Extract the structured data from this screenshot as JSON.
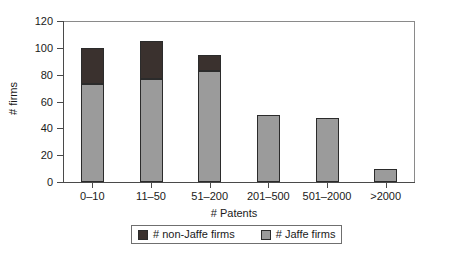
{
  "chart_data": {
    "type": "bar",
    "stacked": true,
    "title": "",
    "xlabel": "# Patents",
    "ylabel": "# firms",
    "categories": [
      "0–10",
      "11–50",
      "51–200",
      "201–500",
      "501–2000",
      ">2000"
    ],
    "series": [
      {
        "name": "# Jaffe firms",
        "color": "#9b9b9b",
        "values": [
          73,
          77,
          83,
          50,
          48,
          10
        ]
      },
      {
        "name": "# non-Jaffe firms",
        "color": "#3a312e",
        "values": [
          27,
          28,
          12,
          0,
          0,
          0
        ]
      }
    ],
    "totals": [
      100,
      105,
      95,
      50,
      48,
      10
    ],
    "ylim": [
      0,
      120
    ],
    "yticks": [
      "0",
      "20",
      "40",
      "60",
      "80",
      "100",
      "120"
    ],
    "ytick_values": [
      0,
      20,
      40,
      60,
      80,
      100,
      120
    ],
    "grid": false,
    "legend_position": "bottom"
  },
  "legend": {
    "entries": [
      {
        "label": "# non-Jaffe firms",
        "swatch": "#3a312e"
      },
      {
        "label": "# Jaffe firms",
        "swatch": "#9b9b9b"
      }
    ]
  }
}
